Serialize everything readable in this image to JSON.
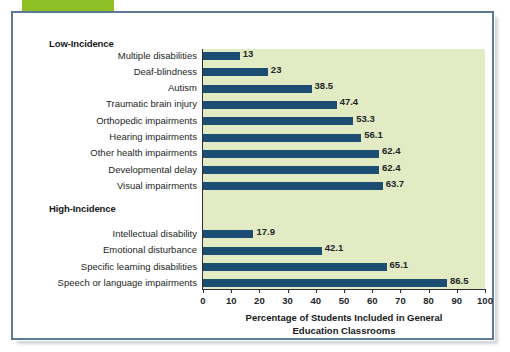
{
  "figure": {
    "accent_green": "#8cc024",
    "frame_color": "#5d7a94",
    "plot_background": "#e2ebc3",
    "bar_color": "#1d4d72",
    "group_low_label": "Low-Incidence",
    "group_high_label": "High-Incidence"
  },
  "chart_data": {
    "type": "bar",
    "orientation": "horizontal",
    "title": "",
    "xlabel": "Percentage of Students Included in General Education Classrooms",
    "xlabel_line1": "Percentage of Students Included in General",
    "xlabel_line2": "Education Classrooms",
    "ylabel": "",
    "xlim": [
      0,
      100
    ],
    "xticks": [
      0,
      10,
      20,
      30,
      40,
      50,
      60,
      70,
      80,
      90,
      100
    ],
    "xtick_labels": [
      "0",
      "10",
      "20",
      "30",
      "40",
      "50",
      "60",
      "70",
      "80",
      "90",
      "100"
    ],
    "grid": false,
    "legend": false,
    "groups": [
      {
        "name": "Low-Incidence",
        "categories": [
          "Multiple disabilities",
          "Deaf-blindness",
          "Autism",
          "Traumatic brain injury",
          "Orthopedic impairments",
          "Hearing impairments",
          "Other health impairments",
          "Developmental delay",
          "Visual impairments"
        ],
        "values": [
          13,
          23,
          38.5,
          47.4,
          53.3,
          56.1,
          62.4,
          62.4,
          63.7
        ],
        "value_labels": [
          "13",
          "23",
          "38.5",
          "47.4",
          "53.3",
          "56.1",
          "62.4",
          "62.4",
          "63.7"
        ]
      },
      {
        "name": "High-Incidence",
        "categories": [
          "Intellectual disability",
          "Emotional disturbance",
          "Specific learning disabilities",
          "Speech or language impairments"
        ],
        "values": [
          17.9,
          42.1,
          65.1,
          86.5
        ],
        "value_labels": [
          "17.9",
          "42.1",
          "65.1",
          "86.5"
        ]
      }
    ],
    "categories": [
      "Multiple disabilities",
      "Deaf-blindness",
      "Autism",
      "Traumatic brain injury",
      "Orthopedic impairments",
      "Hearing impairments",
      "Other health impairments",
      "Developmental delay",
      "Visual impairments",
      "Intellectual disability",
      "Emotional disturbance",
      "Specific learning disabilities",
      "Speech or language impairments"
    ],
    "values": [
      13,
      23,
      38.5,
      47.4,
      53.3,
      56.1,
      62.4,
      62.4,
      63.7,
      17.9,
      42.1,
      65.1,
      86.5
    ]
  }
}
